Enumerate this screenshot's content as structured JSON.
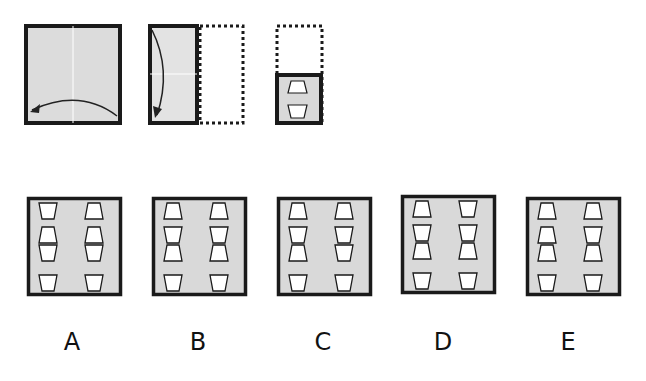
{
  "puzzle": {
    "type": "paper-folding",
    "colors": {
      "paper": "#d9d9d9",
      "paper_light": "#e6e6e6",
      "border": "#1a1a1a",
      "hole": "#ffffff",
      "fold_line": "#ffffff"
    },
    "steps": [
      {
        "id": "step-1",
        "description": "square folded right-to-left along vertical center line",
        "icon": "curved-arrow-left-icon"
      },
      {
        "id": "step-2",
        "description": "half folded top-to-bottom along horizontal center line",
        "icon": "curved-arrow-down-icon"
      },
      {
        "id": "step-3",
        "description": "quarter punched with two trapezoid holes",
        "holes": [
          "trapezoid-narrow-top",
          "trapezoid-wide-top"
        ]
      }
    ],
    "options": [
      {
        "label": "A",
        "left_column": [
          "wide-top",
          "narrow-top",
          "wide-top",
          "wide-top"
        ],
        "right_column": [
          "narrow-top",
          "narrow-top",
          "wide-top",
          "wide-top"
        ]
      },
      {
        "label": "B",
        "left_column": [
          "narrow-top",
          "wide-top",
          "narrow-top",
          "wide-top"
        ],
        "right_column": [
          "narrow-top",
          "wide-top",
          "narrow-top",
          "wide-top"
        ]
      },
      {
        "label": "C",
        "left_column": [
          "narrow-top",
          "wide-top",
          "narrow-top",
          "wide-top"
        ],
        "right_column": [
          "narrow-top",
          "wide-top",
          "wide-top",
          "wide-top"
        ]
      },
      {
        "label": "D",
        "left_column": [
          "narrow-top",
          "wide-top",
          "narrow-top",
          "wide-top"
        ],
        "right_column": [
          "wide-top",
          "wide-top",
          "narrow-top",
          "wide-top"
        ]
      },
      {
        "label": "E",
        "left_column": [
          "narrow-top",
          "narrow-top",
          "narrow-top",
          "wide-top"
        ],
        "right_column": [
          "narrow-top",
          "wide-top",
          "narrow-top",
          "wide-top"
        ]
      }
    ]
  }
}
